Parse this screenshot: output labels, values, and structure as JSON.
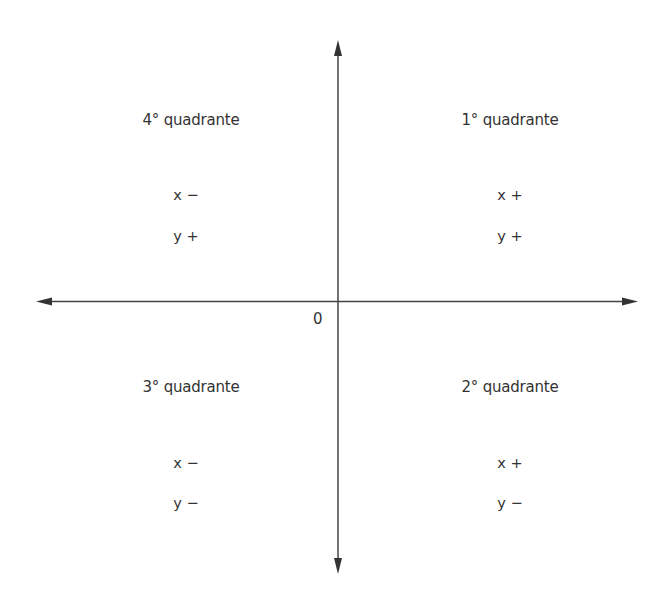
{
  "diagram": {
    "type": "cartesian-plane-quadrants",
    "colors": {
      "axis": "#444444",
      "text": "#333333",
      "background": "#ffffff"
    },
    "origin_label": "0",
    "quadrants": {
      "top_left": {
        "title": "4° quadrante",
        "x_sign": "x −",
        "y_sign": "y +"
      },
      "top_right": {
        "title": "1° quadrante",
        "x_sign": "x +",
        "y_sign": "y +"
      },
      "bottom_left": {
        "title": "3° quadrante",
        "x_sign": "x −",
        "y_sign": "y −"
      },
      "bottom_right": {
        "title": "2° quadrante",
        "x_sign": "x +",
        "y_sign": "y −"
      }
    }
  }
}
